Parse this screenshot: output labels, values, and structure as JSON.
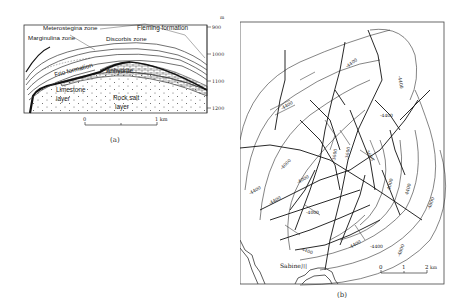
{
  "figure_a": {
    "caption": "(a)",
    "labels": {
      "meterostegina": "Meterostegina zone",
      "fleming": "Fleming formation",
      "marginulina": "Marginulina zone",
      "discorbis": "Discorbis zone",
      "frio": "Frio formation",
      "anhydrite": "Anhydrite",
      "limestone_1": "Limestone",
      "limestone_2": "layer",
      "rocksalt_1": "Rock salt",
      "rocksalt_2": "layer"
    },
    "depth_axis": {
      "unit": "m",
      "ticks": [
        "900",
        "1000",
        "1100",
        "1200"
      ]
    },
    "scale_bar": {
      "start": "0",
      "end": "1 km"
    }
  },
  "figure_b": {
    "caption": "(b)",
    "place_label": "Sabine川",
    "scale_bar": {
      "ticks": [
        "0",
        "1",
        "2"
      ],
      "unit": "km"
    },
    "contour_labels": [
      "4400",
      "4000",
      "3600",
      "4800",
      "-4400",
      "-4000",
      "-3600",
      "-4800"
    ]
  }
}
